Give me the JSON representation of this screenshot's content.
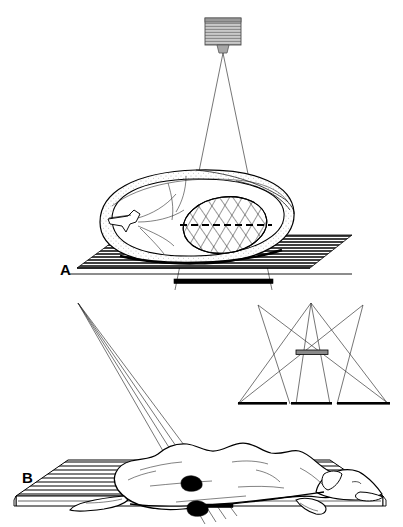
{
  "figure": {
    "background_color": "#ffffff",
    "ink_color": "#000000",
    "width": 403,
    "height": 527,
    "panels": [
      {
        "id": "A",
        "label": "A",
        "caption": "Cross-sectional body with x-ray tube above, collimated beam, patient on table, cassette beneath",
        "label_x": 60,
        "label_y": 274
      },
      {
        "id": "B",
        "label": "B",
        "caption": "Dog in lateral recumbency on table with angled beam and inset tomographic geometry",
        "label_x": 22,
        "label_y": 482
      }
    ]
  },
  "panel_a": {
    "xray_tube": {
      "name": "x-ray-tube-head",
      "housing_color": "#b9b9b9",
      "x": 205,
      "y": 18,
      "width": 36,
      "height": 27,
      "stripe_count": 9
    },
    "tube_neck": {
      "name": "tube-collimator-neck",
      "x": 217,
      "y": 45,
      "width": 12,
      "height": 8
    },
    "beam": {
      "name": "primary-beam-cone",
      "apex_x": 223,
      "apex_y": 53,
      "left_base_x": 175,
      "right_base_x": 272,
      "base_y": 290,
      "ray_count": 2
    },
    "body_section": {
      "name": "body-cross-section",
      "shape": "ovoid",
      "center_x": 196,
      "center_y": 216,
      "rx": 100,
      "ry": 52
    },
    "lesion": {
      "name": "hatched-lesion",
      "fill_pattern": "cross-hatch",
      "center_x": 225,
      "center_y": 225,
      "rx": 42,
      "ry": 28
    },
    "focal_plane": {
      "name": "focal-plane-dashed-line",
      "x1": 180,
      "x2": 272,
      "y": 225,
      "style": "dashed"
    },
    "table": {
      "name": "exam-table-a",
      "hatch": "horizontal-lines",
      "top_left_x": 122,
      "top_right_x": 352,
      "bottom_left_x": 77,
      "bottom_right_x": 310,
      "top_y": 235,
      "bottom_y": 268
    },
    "cassette": {
      "name": "film-cassette-a",
      "x1": 174,
      "x2": 273,
      "y": 281,
      "thickness": 4
    }
  },
  "panel_b": {
    "beam": {
      "name": "angled-beam-fan",
      "apex_x": 78,
      "apex_y": 303,
      "ray_count": 4,
      "target_x": 218,
      "target_y": 515
    },
    "dog": {
      "name": "dog-lateral-recumbent",
      "orientation": "head-right",
      "nose_x": 322,
      "tail_x": 122,
      "back_y": 444
    },
    "markers": [
      {
        "name": "lesion-marker-upper",
        "cx": 191,
        "cy": 484,
        "rx": 11,
        "ry": 6,
        "color": "#000000"
      },
      {
        "name": "lesion-marker-lower",
        "cx": 197,
        "cy": 509,
        "rx": 11,
        "ry": 6,
        "color": "#000000"
      }
    ],
    "table": {
      "name": "exam-table-b",
      "hatch": "horizontal-lines",
      "top_left_x": 68,
      "top_right_x": 330,
      "front_left_x": 16,
      "front_right_x": 383,
      "top_y": 460,
      "front_y": 496,
      "slab_height": 10
    },
    "cassette": {
      "name": "film-cassette-b",
      "x1": 205,
      "x2": 232,
      "y": 506,
      "thickness": 3
    },
    "inset": {
      "name": "tomography-geometry-inset",
      "apexes": [
        {
          "name": "source-left",
          "x": 258,
          "y": 305
        },
        {
          "name": "source-center",
          "x": 311,
          "y": 303
        },
        {
          "name": "source-right",
          "x": 363,
          "y": 305
        }
      ],
      "fulcrum_bar": {
        "name": "fulcrum-object-bar",
        "x1": 296,
        "x2": 328,
        "y": 353,
        "color": "#8a8a8a"
      },
      "films": [
        {
          "name": "film-left",
          "x1": 238,
          "x2": 287,
          "y": 404
        },
        {
          "name": "film-center",
          "x1": 291,
          "x2": 332,
          "y": 404
        },
        {
          "name": "film-right",
          "x1": 337,
          "x2": 390,
          "y": 404
        }
      ]
    }
  }
}
